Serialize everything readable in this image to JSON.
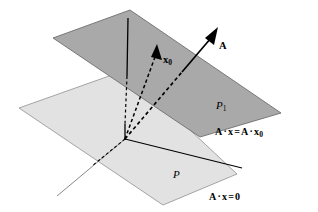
{
  "figure": {
    "colors": {
      "upper_plane_fill": "#a9a9a9",
      "upper_plane_stroke": "#6e6e6e",
      "lower_plane_fill": "#e2e2e2",
      "lower_plane_stroke": "#9a9a9a",
      "line_color": "#000000",
      "background": "#ffffff"
    },
    "planes": [
      {
        "id": "upper-plane",
        "label": "P",
        "label_sub": "1",
        "equation_lhs": "A",
        "equation_text": "A · x = A · x",
        "equation_sub": "0",
        "shade": "dark"
      },
      {
        "id": "lower-plane",
        "label": "P",
        "label_sub": "",
        "equation_text": "A · x = 0",
        "equation_sub": "",
        "shade": "light"
      }
    ],
    "vectors": [
      {
        "id": "vector-A",
        "label": "A",
        "label_sub": "",
        "style": "solid-with-dashed-segment",
        "description": "normal vector A from origin through upper plane"
      },
      {
        "id": "vector-x0",
        "label": "x",
        "label_sub": "0",
        "style": "dashed",
        "description": "position vector x0 from origin to upper plane"
      }
    ],
    "labels": {
      "upper_plane_name": "P",
      "upper_plane_name_sub": "1",
      "lower_plane_name": "P",
      "vector_a_name": "A",
      "vector_x0_name": "x",
      "vector_x0_sub": "0",
      "upper_equation_a1": "A",
      "upper_equation_dot1": "·",
      "upper_equation_x1": "x",
      "upper_equation_eq": "=",
      "upper_equation_a2": "A",
      "upper_equation_dot2": "·",
      "upper_equation_x2": "x",
      "upper_equation_x2_sub": "0",
      "lower_equation_a": "A",
      "lower_equation_dot": "·",
      "lower_equation_x": "x",
      "lower_equation_eq": "=",
      "lower_equation_zero": "0"
    }
  }
}
